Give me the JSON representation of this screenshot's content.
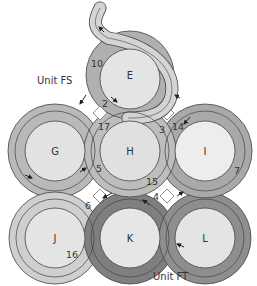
{
  "diagram": {
    "colors": {
      "background": "#ffffff",
      "circle_fill": "#e2e2e2",
      "circle_fill_light": "#ececec",
      "band_light": "#c9c9c9",
      "band_mid": "#b2b2b2",
      "band_dark": "#8c8c8c",
      "band_darker": "#7a7a7a",
      "outline": "#444444",
      "text": "#333333"
    },
    "units": [
      {
        "id": "unit-fs",
        "label": "Unit FS"
      },
      {
        "id": "unit-ft",
        "label": "Unit FT"
      }
    ],
    "circles": [
      {
        "id": "E",
        "label": "E"
      },
      {
        "id": "G",
        "label": "G"
      },
      {
        "id": "H",
        "label": "H"
      },
      {
        "id": "I",
        "label": "I"
      },
      {
        "id": "J",
        "label": "J"
      },
      {
        "id": "K",
        "label": "K"
      },
      {
        "id": "L",
        "label": "L"
      }
    ],
    "band_numbers": [
      "10",
      "2",
      "17",
      "3",
      "14",
      "5",
      "15",
      "4",
      "7",
      "6",
      "16"
    ]
  }
}
